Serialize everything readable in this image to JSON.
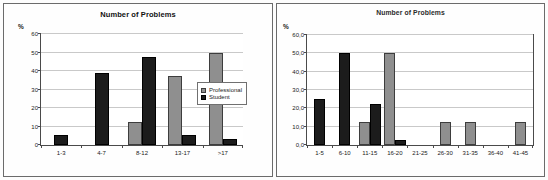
{
  "figure": {
    "panels": [
      {
        "id": "left",
        "title": "Number of Problems",
        "y_axis_label": "%"
      },
      {
        "id": "right",
        "title": "Number of Problems",
        "y_axis_label": "%"
      }
    ]
  },
  "legend": {
    "items": [
      {
        "label": "Professional",
        "swatch": "professional"
      },
      {
        "label": "Student",
        "swatch": "student"
      }
    ]
  },
  "chart_data": [
    {
      "type": "bar",
      "id": "left-chart",
      "title": "Number of Problems",
      "xlabel": "",
      "ylabel": "%",
      "ylim": [
        0,
        60
      ],
      "yticks": [
        0,
        10,
        20,
        30,
        40,
        50,
        60
      ],
      "ytick_labels": [
        "0",
        "10",
        "20",
        "30",
        "40",
        "50",
        "60"
      ],
      "grid": true,
      "legend_position": "right",
      "categories": [
        "1-3",
        "4-7",
        "8-12",
        "13-17",
        ">17"
      ],
      "series": [
        {
          "name": "Professional",
          "color": "#8f8f8f",
          "values": [
            0,
            0,
            12.5,
            37.5,
            50
          ]
        },
        {
          "name": "Student",
          "color": "#1c1c1c",
          "values": [
            5.5,
            39,
            47.5,
            5.5,
            3
          ]
        }
      ]
    },
    {
      "type": "bar",
      "id": "right-chart",
      "title": "Number of Problems",
      "xlabel": "",
      "ylabel": "%",
      "ylim": [
        0,
        60
      ],
      "yticks": [
        0,
        10,
        20,
        30,
        40,
        50,
        60
      ],
      "ytick_labels": [
        "0,0",
        "10,0",
        "20,0",
        "30,0",
        "40,0",
        "50,0",
        "60,0"
      ],
      "grid": true,
      "legend_position": "none",
      "categories": [
        "1-5",
        "6-10",
        "11-15",
        "16-20",
        "21-25",
        "26-30",
        "31-35",
        "36-40",
        "41-45"
      ],
      "series": [
        {
          "name": "Professional",
          "color": "#8f8f8f",
          "values": [
            0,
            0,
            12.5,
            50,
            0,
            12.5,
            12.5,
            0,
            12.5
          ]
        },
        {
          "name": "Student",
          "color": "#1c1c1c",
          "values": [
            25,
            50,
            22.5,
            3,
            0,
            0,
            0,
            0,
            0
          ]
        }
      ]
    }
  ]
}
